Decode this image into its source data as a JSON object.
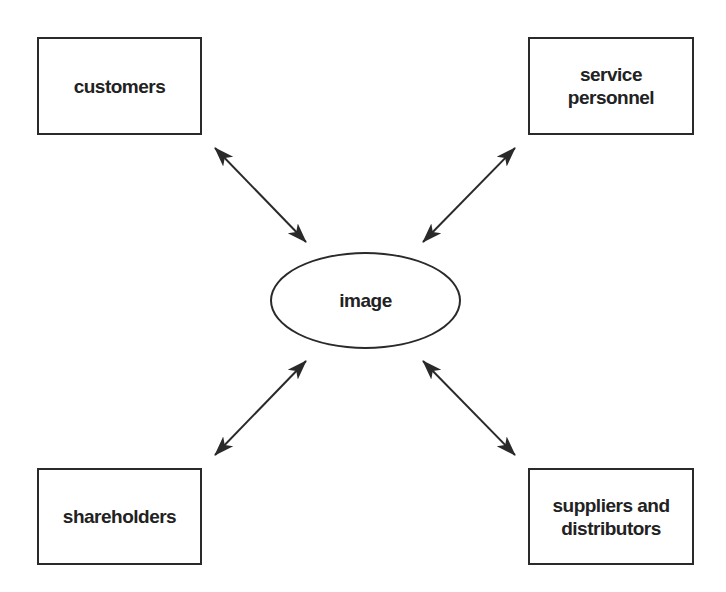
{
  "diagram": {
    "center": {
      "label": "image"
    },
    "nodes": [
      {
        "id": "customers",
        "label": "customers",
        "position": "top-left"
      },
      {
        "id": "service-personnel",
        "label": "service\npersonnel",
        "position": "top-right"
      },
      {
        "id": "shareholders",
        "label": "shareholders",
        "position": "bottom-left"
      },
      {
        "id": "suppliers-distributors",
        "label": "suppliers and\ndistributors",
        "position": "bottom-right"
      }
    ],
    "edges": [
      {
        "from": "customers",
        "to": "image",
        "type": "bidirectional"
      },
      {
        "from": "service-personnel",
        "to": "image",
        "type": "bidirectional"
      },
      {
        "from": "shareholders",
        "to": "image",
        "type": "bidirectional"
      },
      {
        "from": "suppliers-distributors",
        "to": "image",
        "type": "bidirectional"
      }
    ],
    "colors": {
      "stroke": "#2a2a2a",
      "text": "#222222",
      "background": "#ffffff"
    }
  }
}
